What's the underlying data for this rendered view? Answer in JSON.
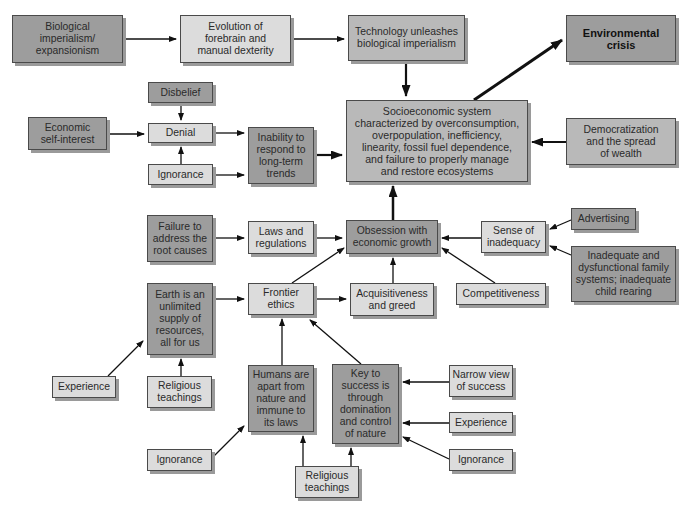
{
  "diagram": {
    "type": "flowchart",
    "nodes": {
      "biological_imperialism": "Biological\nimperialism/\nexpansionism",
      "evolution_forebrain": "Evolution of\nforebrain and\nmanual dexterity",
      "technology_unleashes": "Technology unleashes\nbiological imperialism",
      "environmental_crisis": "Environmental\ncrisis",
      "disbelief": "Disbelief",
      "economic_self_interest": "Economic\nself-interest",
      "denial": "Denial",
      "ignorance_top": "Ignorance",
      "inability_to_respond": "Inability to\nrespond to\nlong-term\ntrends",
      "socioeconomic_system": "Socioeconomic system\ncharacterized by overconsumption,\noverpopulation, inefficiency,\nlinearity, fossil fuel dependence,\nand failure to properly manage\nand restore ecosystems",
      "democratization": "Democratization\nand the spread\nof wealth",
      "failure_root_causes": "Failure to\naddress the\nroot causes",
      "laws_regulations": "Laws and\nregulations",
      "obsession_growth": "Obsession with\neconomic growth",
      "sense_of_inadequacy": "Sense of\ninadequacy",
      "advertising": "Advertising",
      "inadequate_family": "Inadequate and\ndysfunctional family\nsystems; inadequate\nchild rearing",
      "earth_unlimited": "Earth is an\nunlimited\nsupply of\nresources,\nall for us",
      "frontier_ethics": "Frontier\nethics",
      "acquisitiveness": "Acquisitiveness\nand greed",
      "competitiveness": "Competitiveness",
      "experience_left": "Experience",
      "religious_teachings_left": "Religious\nteachings",
      "humans_apart": "Humans are\napart from\nnature and\nimmune to\nits laws",
      "key_to_success": "Key to\nsuccess is\nthrough\ndomination\nand control\nof nature",
      "narrow_view": "Narrow view\nof success",
      "experience_right": "Experience",
      "ignorance_right": "Ignorance",
      "ignorance_bottom": "Ignorance",
      "religious_teachings_bottom": "Religious\nteachings"
    },
    "edges": [
      [
        "biological_imperialism",
        "evolution_forebrain"
      ],
      [
        "evolution_forebrain",
        "technology_unleashes"
      ],
      [
        "technology_unleashes",
        "socioeconomic_system"
      ],
      [
        "socioeconomic_system",
        "environmental_crisis"
      ],
      [
        "disbelief",
        "denial"
      ],
      [
        "economic_self_interest",
        "denial"
      ],
      [
        "ignorance_top",
        "denial"
      ],
      [
        "denial",
        "inability_to_respond"
      ],
      [
        "ignorance_top",
        "inability_to_respond"
      ],
      [
        "inability_to_respond",
        "socioeconomic_system"
      ],
      [
        "democratization",
        "socioeconomic_system"
      ],
      [
        "obsession_growth",
        "socioeconomic_system"
      ],
      [
        "failure_root_causes",
        "laws_regulations"
      ],
      [
        "laws_regulations",
        "obsession_growth"
      ],
      [
        "sense_of_inadequacy",
        "obsession_growth"
      ],
      [
        "advertising",
        "sense_of_inadequacy"
      ],
      [
        "inadequate_family",
        "sense_of_inadequacy"
      ],
      [
        "frontier_ethics",
        "obsession_growth"
      ],
      [
        "acquisitiveness",
        "obsession_growth"
      ],
      [
        "competitiveness",
        "obsession_growth"
      ],
      [
        "earth_unlimited",
        "frontier_ethics"
      ],
      [
        "frontier_ethics",
        "acquisitiveness"
      ],
      [
        "experience_left",
        "earth_unlimited"
      ],
      [
        "religious_teachings_left",
        "earth_unlimited"
      ],
      [
        "humans_apart",
        "frontier_ethics"
      ],
      [
        "key_to_success",
        "frontier_ethics"
      ],
      [
        "narrow_view",
        "key_to_success"
      ],
      [
        "experience_right",
        "key_to_success"
      ],
      [
        "ignorance_right",
        "key_to_success"
      ],
      [
        "ignorance_bottom",
        "humans_apart"
      ],
      [
        "religious_teachings_bottom",
        "humans_apart"
      ],
      [
        "religious_teachings_bottom",
        "key_to_success"
      ]
    ]
  },
  "colors": {
    "dark_fill": "#9d9d9d",
    "mid_fill": "#b9b9b9",
    "light_fill": "#dcdcdc",
    "border": "#4a4a4a",
    "arrow": "#111111"
  }
}
